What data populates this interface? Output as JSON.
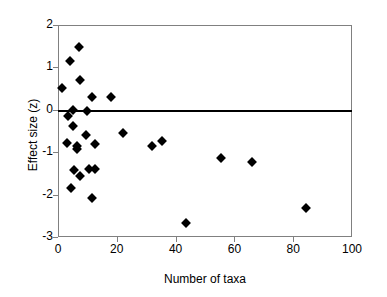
{
  "chart_data": {
    "type": "scatter",
    "title": "",
    "xlabel": "Number of taxa",
    "ylabel": "Effect size (z)",
    "xlim": [
      0,
      100
    ],
    "ylim": [
      -3,
      2
    ],
    "xticks": [
      "0",
      "20",
      "40",
      "60",
      "80",
      "100"
    ],
    "yticks": [
      "2",
      "1",
      "0",
      "-1",
      "-2",
      "-3"
    ],
    "grid": false,
    "legend": null,
    "annotations": [
      {
        "type": "hline",
        "y": 0,
        "label": "zero effect reference line",
        "color": "#000000"
      }
    ],
    "marker": "diamond",
    "marker_color": "#000000",
    "points": [
      {
        "x": 1.5,
        "y": 0.51
      },
      {
        "x": 4.0,
        "y": 1.16
      },
      {
        "x": 7.0,
        "y": 1.48
      },
      {
        "x": 7.5,
        "y": 0.7
      },
      {
        "x": 11.5,
        "y": 0.3
      },
      {
        "x": 18.0,
        "y": 0.31
      },
      {
        "x": 5.0,
        "y": 0.0
      },
      {
        "x": 10.0,
        "y": -0.04
      },
      {
        "x": 3.5,
        "y": -0.15
      },
      {
        "x": 5.0,
        "y": -0.38
      },
      {
        "x": 9.5,
        "y": -0.59
      },
      {
        "x": 22.0,
        "y": -0.55
      },
      {
        "x": 3.0,
        "y": -0.79
      },
      {
        "x": 12.5,
        "y": -0.8
      },
      {
        "x": 6.5,
        "y": -0.86
      },
      {
        "x": 6.5,
        "y": -0.92
      },
      {
        "x": 32.0,
        "y": -0.86
      },
      {
        "x": 35.5,
        "y": -0.73
      },
      {
        "x": 55.5,
        "y": -1.14
      },
      {
        "x": 66.0,
        "y": -1.24
      },
      {
        "x": 5.5,
        "y": -1.42
      },
      {
        "x": 10.5,
        "y": -1.39
      },
      {
        "x": 12.5,
        "y": -1.39
      },
      {
        "x": 7.5,
        "y": -1.55
      },
      {
        "x": 4.5,
        "y": -1.84
      },
      {
        "x": 11.5,
        "y": -2.09
      },
      {
        "x": 43.5,
        "y": -2.67
      },
      {
        "x": 84.5,
        "y": -2.31
      }
    ]
  }
}
